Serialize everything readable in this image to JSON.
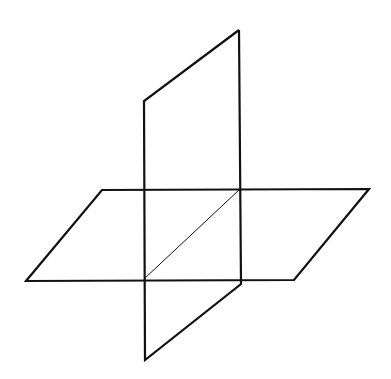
{
  "diagram": {
    "stroke_color": "#111111",
    "background": "#ffffff",
    "vertical_plane": {
      "points": [
        [
          239,
          30
        ],
        [
          144,
          101
        ],
        [
          144,
          360
        ],
        [
          146,
          360
        ],
        [
          241,
          284
        ],
        [
          239,
          30
        ]
      ]
    },
    "horizontal_plane": {
      "points": [
        [
          102,
          190
        ],
        [
          369,
          189
        ],
        [
          294,
          280
        ],
        [
          26,
          281
        ]
      ]
    },
    "intersection_line": {
      "x1": 239,
      "y1": 190,
      "x2": 144,
      "y2": 279
    }
  }
}
